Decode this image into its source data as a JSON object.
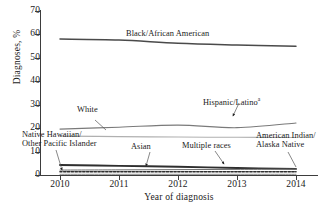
{
  "chart_data": {
    "type": "line",
    "title": "",
    "xlabel": "Year of diagnosis",
    "ylabel": "Diagnoses, %",
    "x": [
      2010,
      2011,
      2012,
      2013,
      2014
    ],
    "xlim": [
      2010,
      2014
    ],
    "ylim": [
      0,
      70
    ],
    "ytick_values": [
      0,
      10,
      20,
      30,
      40,
      50,
      60,
      70
    ],
    "xtick_labels": [
      "2010",
      "2011",
      "2012",
      "2013",
      "2014"
    ],
    "grid": false,
    "legend_position": "inline-annotations",
    "series": [
      {
        "name": "Black/African American",
        "values": [
          58.0,
          57.6,
          56.2,
          55.5,
          55.0
        ],
        "color": "#4a4a4a"
      },
      {
        "name": "Hispanic/Latino",
        "values": [
          19.6,
          20.4,
          21.3,
          20.2,
          22.2
        ],
        "color": "#7a7a7a"
      },
      {
        "name": "White",
        "values": [
          16.6,
          16.4,
          16.2,
          16.1,
          16.0
        ],
        "color": "#b0b0b0"
      },
      {
        "name": "Multiple races",
        "values": [
          4.3,
          3.9,
          3.5,
          3.0,
          2.6
        ],
        "color": "#2e2e2e"
      },
      {
        "name": "American Indian/Alaska Native",
        "values": [
          1.4,
          1.4,
          1.4,
          1.4,
          1.4
        ],
        "color": "#2e2e2e"
      },
      {
        "name": "Asian",
        "values": [
          2.1,
          2.2,
          2.3,
          2.4,
          2.5
        ],
        "color": "#6e6e6e"
      },
      {
        "name": "Native Hawaiian/Other Pacific Islander",
        "values": [
          0.3,
          0.3,
          0.3,
          0.3,
          0.3
        ],
        "color": "#8a8a8a"
      }
    ]
  },
  "annotations": {
    "black_african_american": "Black/African American",
    "white": "White",
    "hispanic_latino": "Hispanic/Latino",
    "hispanic_latino_footnote": "a",
    "native_hawaiian_line1": "Native Hawaiian/",
    "native_hawaiian_line2": "Other Pacific Islander",
    "asian": "Asian",
    "multiple_races": "Multiple races",
    "american_indian_line1": "American Indian/",
    "american_indian_line2": "Alaska Native"
  },
  "axes": {
    "y_title": "Diagnoses, %",
    "x_title": "Year of diagnosis",
    "y_ticks": [
      "70",
      "60",
      "50",
      "40",
      "30",
      "20",
      "10",
      "0"
    ],
    "x_ticks": [
      "2010",
      "2011",
      "2012",
      "2013",
      "2014"
    ]
  }
}
